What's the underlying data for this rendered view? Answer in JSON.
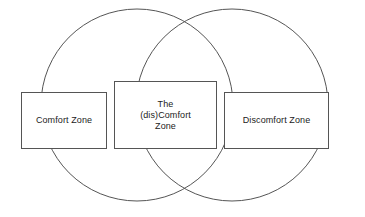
{
  "diagram": {
    "type": "venn-2-circle",
    "background_color": "#ffffff",
    "stroke_color": "#555555",
    "text_color": "#1b1b1b",
    "circles": [
      {
        "name": "left-circle",
        "cx": 137,
        "cy": 105,
        "r": 96
      },
      {
        "name": "right-circle",
        "cx": 232,
        "cy": 105,
        "r": 96
      }
    ],
    "boxes": {
      "left": {
        "label": "Comfort Zone"
      },
      "middle": {
        "label": "The\n(dis)Comfort\nZone"
      },
      "right": {
        "label": "Discomfort Zone"
      }
    }
  }
}
